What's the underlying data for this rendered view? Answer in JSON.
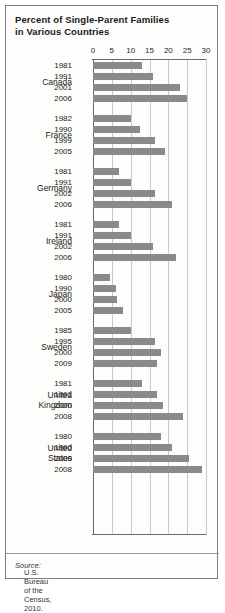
{
  "title": "Percent of Single-Parent Families in Various Countries",
  "title_line1": "Percent of Single-Parent Families",
  "title_line2": "in Various Countries",
  "source_label": "Source:",
  "source_text": "U.S. Bureau of the Census, 2010.",
  "colors": {
    "bar": "#8a8a8a",
    "grid": "#c9c9c9",
    "axis": "#6a6a6a",
    "text": "#1a1a1a",
    "frame": "#7d7d7d"
  },
  "chart_data": {
    "type": "bar",
    "orientation": "horizontal",
    "title": "Percent of Single-Parent Families in Various Countries",
    "xlabel": "",
    "ylabel": "",
    "xlim": [
      0,
      30
    ],
    "xticks": [
      0,
      5,
      10,
      15,
      20,
      25,
      30
    ],
    "tick_labels": [
      "0",
      "5",
      "10",
      "15",
      "20",
      "25",
      "30"
    ],
    "grid": true,
    "legend": "none",
    "source": "Source: U.S. Bureau of the Census, 2010.",
    "groups": [
      {
        "country": "Canada",
        "rows": [
          {
            "year": "1981",
            "value": 13
          },
          {
            "year": "1991",
            "value": 16
          },
          {
            "year": "2001",
            "value": 23
          },
          {
            "year": "2006",
            "value": 25
          }
        ]
      },
      {
        "country": "France",
        "rows": [
          {
            "year": "1982",
            "value": 10
          },
          {
            "year": "1990",
            "value": 12.5
          },
          {
            "year": "1999",
            "value": 16.5
          },
          {
            "year": "2005",
            "value": 19
          }
        ]
      },
      {
        "country": "Germany",
        "rows": [
          {
            "year": "1981",
            "value": 7
          },
          {
            "year": "1991",
            "value": 10
          },
          {
            "year": "2002",
            "value": 16.5
          },
          {
            "year": "2006",
            "value": 21
          }
        ]
      },
      {
        "country": "Ireland",
        "rows": [
          {
            "year": "1981",
            "value": 7
          },
          {
            "year": "1991",
            "value": 10
          },
          {
            "year": "2002",
            "value": 16
          },
          {
            "year": "2006",
            "value": 22
          }
        ]
      },
      {
        "country": "Japan",
        "rows": [
          {
            "year": "1980",
            "value": 4.5
          },
          {
            "year": "1990",
            "value": 6
          },
          {
            "year": "2000",
            "value": 6.5
          },
          {
            "year": "2005",
            "value": 8
          }
        ]
      },
      {
        "country": "Sweden",
        "rows": [
          {
            "year": "1985",
            "value": 10
          },
          {
            "year": "1995",
            "value": 16.5
          },
          {
            "year": "2000",
            "value": 18
          },
          {
            "year": "2009",
            "value": 17
          }
        ]
      },
      {
        "country": "United Kingdom",
        "country_line1": "United",
        "country_line2": "Kingdom",
        "rows": [
          {
            "year": "1981",
            "value": 13
          },
          {
            "year": "1991",
            "value": 17
          },
          {
            "year": "2000",
            "value": 18.5
          },
          {
            "year": "2008",
            "value": 24
          }
        ]
      },
      {
        "country": "United States",
        "country_line1": "United",
        "country_line2": "States",
        "rows": [
          {
            "year": "1980",
            "value": 18
          },
          {
            "year": "1990",
            "value": 21
          },
          {
            "year": "2000",
            "value": 25.5
          },
          {
            "year": "2008",
            "value": 29
          }
        ]
      }
    ]
  }
}
